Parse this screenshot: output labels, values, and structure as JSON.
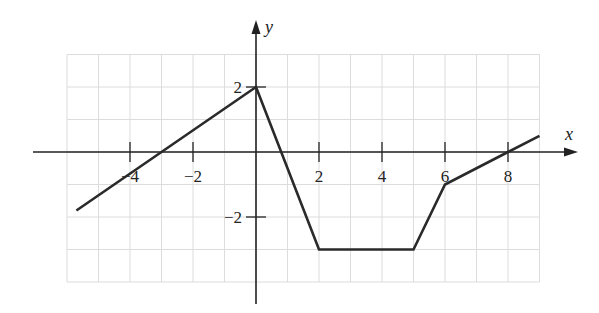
{
  "chart_data": {
    "type": "line",
    "title": "",
    "xlabel": "x",
    "ylabel": "y",
    "xlim": [
      -6,
      9
    ],
    "ylim": [
      -4,
      3
    ],
    "grid": true,
    "legend": null,
    "x_ticks": [
      {
        "value": -4,
        "label": "−4"
      },
      {
        "value": -2,
        "label": "−2"
      },
      {
        "value": 2,
        "label": "2"
      },
      {
        "value": 4,
        "label": "4"
      },
      {
        "value": 6,
        "label": "6"
      },
      {
        "value": 8,
        "label": "8"
      }
    ],
    "y_ticks": [
      {
        "value": 2,
        "label": "2"
      },
      {
        "value": -2,
        "label": "−2"
      }
    ],
    "series": [
      {
        "name": "f(x)",
        "points": [
          [
            -5.7,
            -1.8
          ],
          [
            0,
            2
          ],
          [
            2,
            -3
          ],
          [
            5,
            -3
          ],
          [
            6,
            -1
          ],
          [
            8,
            0
          ],
          [
            9,
            0.5
          ]
        ]
      }
    ]
  },
  "layout": {
    "origin_px": [
      256,
      152
    ],
    "x_scale": 31.5,
    "y_scale": 32.5,
    "x_axis_px": [
      33,
      578
    ],
    "y_axis_px": [
      20,
      304
    ],
    "grid_x_range": [
      -6,
      9
    ],
    "grid_y_range": [
      -4,
      3
    ]
  },
  "colors": {
    "axis": "#222222",
    "line": "#2a2a2a",
    "grid": "#dcdcdc"
  }
}
